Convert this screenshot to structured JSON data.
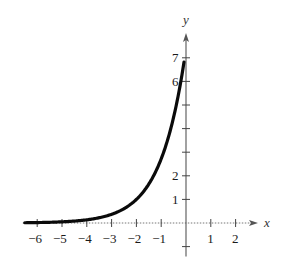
{
  "chart_data": {
    "type": "line",
    "title": "",
    "function": "y = e^(x+2)",
    "xlabel": "x",
    "ylabel": "y",
    "xlim": [
      -6.5,
      2.9
    ],
    "ylim": [
      -1,
      8
    ],
    "grid": false,
    "legend": null,
    "x_ticks": [
      -6,
      -5,
      -4,
      -3,
      -2,
      -1,
      1,
      2
    ],
    "x_tick_labels": [
      "−6",
      "−5",
      "−4",
      "−3",
      "−2",
      "−1",
      "1",
      "2"
    ],
    "y_ticks": [
      -1,
      1,
      2,
      3,
      4,
      5,
      6,
      7
    ],
    "y_tick_labels_shown": [
      {
        "value": 1,
        "label": "1"
      },
      {
        "value": 2,
        "label": "2"
      },
      {
        "value": 6,
        "label": "6"
      },
      {
        "value": 7,
        "label": "7"
      }
    ],
    "series": [
      {
        "name": "curve",
        "x": [
          -6.5,
          -6,
          -5,
          -4,
          -3,
          -2,
          -1.5,
          -1,
          -0.5,
          0
        ],
        "y": [
          0.011,
          0.018,
          0.05,
          0.135,
          0.368,
          1.0,
          1.649,
          2.718,
          4.482,
          7.389
        ]
      }
    ],
    "pixel_mapping": {
      "origin_px": [
        186,
        223
      ],
      "x_unit_px": 24.8,
      "y_unit_px": 23.6
    }
  },
  "labels": {
    "x_axis": "x",
    "y_axis": "y"
  }
}
